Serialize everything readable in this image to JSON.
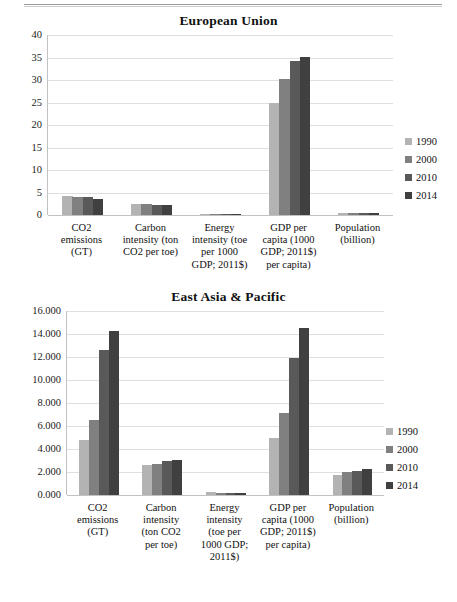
{
  "page": {
    "header_rule": true
  },
  "legend_years": [
    "1990",
    "2000",
    "2010",
    "2014"
  ],
  "series_colors": [
    "#b3b3b3",
    "#808080",
    "#595959",
    "#404040"
  ],
  "charts": [
    {
      "id": "eu",
      "title": "European Union",
      "legend_position": "right",
      "chart_data": {
        "type": "bar",
        "title": "European Union",
        "xlabel": "",
        "ylabel": "",
        "ylim": [
          0,
          40
        ],
        "yticks": [
          "0",
          "5",
          "10",
          "15",
          "20",
          "25",
          "30",
          "35",
          "40"
        ],
        "grid": true,
        "legend": [
          "1990",
          "2000",
          "2010",
          "2014"
        ],
        "categories": [
          "CO2 emissions (GT)",
          "Carbon intensity (ton CO2 per toe)",
          "Energy intensity (toe per 1000 GDP; 2011$)",
          "GDP per capita (1000 GDP; 2011$) per capita)",
          "Population (billion)"
        ],
        "series": [
          {
            "name": "1990",
            "values": [
              4.3,
              2.5,
              0.12,
              24.8,
              0.47
            ]
          },
          {
            "name": "2000",
            "values": [
              4.1,
              2.4,
              0.1,
              30.3,
              0.48
            ]
          },
          {
            "name": "2010",
            "values": [
              3.9,
              2.2,
              0.08,
              34.2,
              0.5
            ]
          },
          {
            "name": "2014",
            "values": [
              3.5,
              2.2,
              0.07,
              35.1,
              0.51
            ]
          }
        ]
      },
      "x_categories": [
        "CO2\nemissions\n(GT)",
        "Carbon\nintensity (ton\nCO2 per toe)",
        "Energy\nintensity (toe\nper 1000\nGDP; 2011$)",
        "GDP per\ncapita (1000\nGDP; 2011$)\nper capita)",
        "Population\n(billion)"
      ]
    },
    {
      "id": "eap",
      "title": "East Asia & Pacific",
      "legend_position": "right",
      "chart_data": {
        "type": "bar",
        "title": "East Asia & Pacific",
        "xlabel": "",
        "ylabel": "",
        "ylim": [
          0,
          16
        ],
        "yticks": [
          "0.000",
          "2.000",
          "4.000",
          "6.000",
          "8.000",
          "10.000",
          "12.000",
          "14.000",
          "16.000"
        ],
        "grid": true,
        "legend": [
          "1990",
          "2000",
          "2010",
          "2014"
        ],
        "categories": [
          "CO2 emissions (GT)",
          "Carbon intensity (ton CO2 per toe)",
          "Energy intensity (toe per 1000 GDP; 2011$)",
          "GDP per capita (1000 GDP; 2011$) per capita)",
          "Population (billion)"
        ],
        "series": [
          {
            "name": "1990",
            "values": [
              4.75,
              2.62,
              0.22,
              4.95,
              1.78
            ]
          },
          {
            "name": "2000",
            "values": [
              6.55,
              2.68,
              0.18,
              7.15,
              1.97
            ]
          },
          {
            "name": "2010",
            "values": [
              12.6,
              2.98,
              0.15,
              11.95,
              2.12
            ]
          },
          {
            "name": "2014",
            "values": [
              14.25,
              3.05,
              0.14,
              14.5,
              2.25
            ]
          }
        ]
      },
      "x_categories": [
        "CO2\nemissions\n(GT)",
        "Carbon\nintensity\n(ton CO2\nper toe)",
        "Energy\nintensity\n(toe per\n1000 GDP;\n2011$)",
        "GDP per\ncapita (1000\nGDP; 2011$)\nper capita)",
        "Population\n(billion)"
      ]
    }
  ]
}
